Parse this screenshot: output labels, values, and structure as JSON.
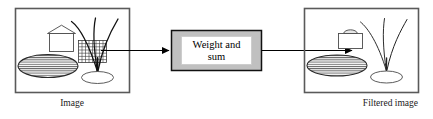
{
  "figure": {
    "title": "",
    "background_color": "#ffffff",
    "stroke_color": "#000000",
    "panel_border_color": "#5a5a5a",
    "process_box_fill": "#c0c0c0",
    "process_box_label_fill": "#ffffff"
  },
  "panels": {
    "left": {
      "caption": "Image",
      "caption_align": "center",
      "contents": [
        "house-shape",
        "checkerboard-grid",
        "tree-branches",
        "hatched-ellipse",
        "ground-ellipse"
      ]
    },
    "right": {
      "caption": "Filtered image",
      "caption_align": "right",
      "contents": [
        "blurred-house-shape",
        "tree-branches",
        "hatched-ellipse",
        "ground-ellipse"
      ]
    }
  },
  "process_box": {
    "line1": "Weight and",
    "line2": "sum",
    "full_label": "Weight and sum"
  },
  "arrows": {
    "input_arrow": {
      "name": "arrow-image-to-weightsum",
      "direction": "left-to-right"
    },
    "output_arrow": {
      "name": "arrow-weightsum-to-filtered",
      "direction": "left-to-right"
    }
  }
}
